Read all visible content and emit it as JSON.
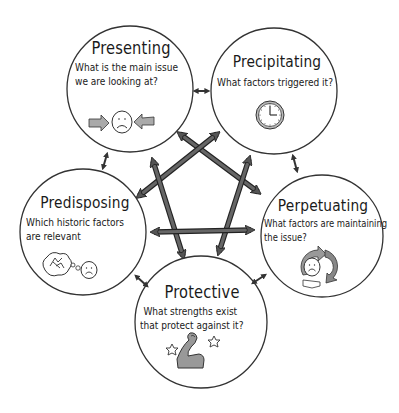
{
  "diagram": {
    "type": "5P formulation cycle",
    "colors": {
      "outline": "#333333",
      "arrow_fill": "#555555",
      "icon_fill": "#9a9a9a",
      "background": "#ffffff"
    },
    "nodes": [
      {
        "id": "presenting",
        "title": "Presenting",
        "question_lines": [
          "What is the main issue",
          "we are looking at?"
        ],
        "icon": "sad-face-with-arrows-icon"
      },
      {
        "id": "precipitating",
        "title": "Precipitating",
        "question_lines": [
          "What factors triggered it?"
        ],
        "icon": "clock-icon"
      },
      {
        "id": "perpetuating",
        "title": "Perpetuating",
        "question_lines": [
          "What factors are maintaining",
          "the issue?"
        ],
        "icon": "cycle-sad-face-icon"
      },
      {
        "id": "protective",
        "title": "Protective",
        "question_lines": [
          "What strengths exist",
          "that protect against it?"
        ],
        "icon": "flexed-arm-stars-icon"
      },
      {
        "id": "predisposing",
        "title": "Predisposing",
        "question_lines": [
          "Which historic factors",
          "are relevant"
        ],
        "icon": "thought-bubble-sad-face-icon"
      }
    ],
    "connections": [
      {
        "from": "presenting",
        "to": "precipitating",
        "kind": "adjacent"
      },
      {
        "from": "precipitating",
        "to": "perpetuating",
        "kind": "adjacent"
      },
      {
        "from": "perpetuating",
        "to": "protective",
        "kind": "adjacent"
      },
      {
        "from": "protective",
        "to": "predisposing",
        "kind": "adjacent"
      },
      {
        "from": "predisposing",
        "to": "presenting",
        "kind": "adjacent"
      },
      {
        "from": "presenting",
        "to": "perpetuating",
        "kind": "cross"
      },
      {
        "from": "presenting",
        "to": "protective",
        "kind": "cross"
      },
      {
        "from": "precipitating",
        "to": "predisposing",
        "kind": "cross"
      },
      {
        "from": "precipitating",
        "to": "protective",
        "kind": "cross"
      },
      {
        "from": "predisposing",
        "to": "perpetuating",
        "kind": "cross"
      }
    ]
  }
}
